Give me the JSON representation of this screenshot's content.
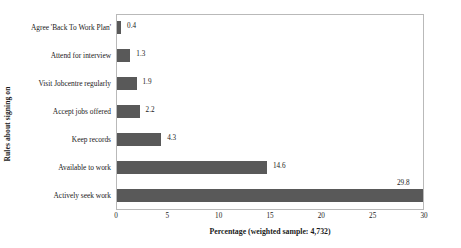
{
  "chart_data": {
    "type": "bar",
    "orientation": "horizontal",
    "title": "",
    "xlabel": "Percentage (weighted sample: 4,732)",
    "ylabel": "Rules about signing on",
    "categories": [
      "Agree 'Back To Work Plan'",
      "Attend for interview",
      "Visit Jobcentre regularly",
      "Accept jobs offered",
      "Keep records",
      "Available to work",
      "Actively seek work"
    ],
    "values": [
      0.4,
      1.3,
      1.9,
      2.2,
      4.3,
      14.6,
      29.8
    ],
    "value_labels": [
      "0.4",
      "1.3",
      "1.9",
      "2.2",
      "4.3",
      "14.6",
      "29.8"
    ],
    "xlim": [
      0,
      30
    ],
    "xticks": [
      0,
      5,
      10,
      15,
      20,
      25,
      30
    ],
    "xtick_labels": [
      "0",
      "5",
      "10",
      "15",
      "20",
      "25",
      "30"
    ],
    "grid": false,
    "legend": false,
    "bar_color": "#595959",
    "frame_color": "#b9b9b9"
  }
}
